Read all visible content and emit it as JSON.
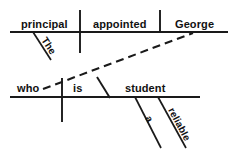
{
  "diagram": {
    "type": "reed-kellogg-sentence-diagram",
    "sentence": "The principal appointed George, who is a reliable student.",
    "ink_color": "#1a1a1a",
    "background_color": "#ffffff",
    "main_clause": {
      "subject": "principal",
      "subject_modifier": "The",
      "verb": "appointed",
      "direct_object": "George"
    },
    "relative_clause": {
      "subject": "who",
      "verb": "is",
      "predicate_nominative": "student",
      "modifier_article": "a",
      "modifier_adjective": "reliable"
    },
    "labels": {
      "the": "The",
      "principal": "principal",
      "appointed": "appointed",
      "george": "George",
      "who": "who",
      "is": "is",
      "student": "student",
      "a": "a",
      "reliable": "reliable"
    }
  }
}
